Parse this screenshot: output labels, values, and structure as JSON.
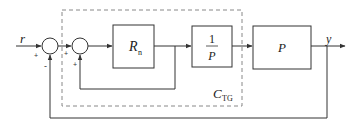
{
  "diagram": {
    "type": "block-diagram",
    "colors": {
      "line": "#333333",
      "dashed_box": "#888888",
      "text": "#222222"
    },
    "input_signal": {
      "label": "r"
    },
    "output_signal": {
      "label": "y"
    },
    "summing_junctions": [
      {
        "id": "sum1",
        "signs": {
          "left": "+",
          "bottom": "-"
        }
      },
      {
        "id": "sum2",
        "signs": {
          "left": "+",
          "bottom": "+"
        }
      }
    ],
    "blocks": [
      {
        "id": "Rn",
        "label_main": "R",
        "label_sub": "n"
      },
      {
        "id": "inv_P",
        "numerator": "1",
        "denominator": "P"
      },
      {
        "id": "plant",
        "label": "P"
      }
    ],
    "controller_group": {
      "label_main": "C",
      "label_sub": "TG"
    },
    "edges": [
      {
        "from": "r",
        "to": "sum1"
      },
      {
        "from": "sum1",
        "to": "sum2"
      },
      {
        "from": "sum2",
        "to": "Rn"
      },
      {
        "from": "Rn",
        "to": "inv_P"
      },
      {
        "from": "Rn",
        "to": "sum2",
        "type": "inner-feedback"
      },
      {
        "from": "inv_P",
        "to": "plant"
      },
      {
        "from": "plant",
        "to": "y"
      },
      {
        "from": "y",
        "to": "sum1",
        "type": "outer-feedback"
      }
    ]
  }
}
